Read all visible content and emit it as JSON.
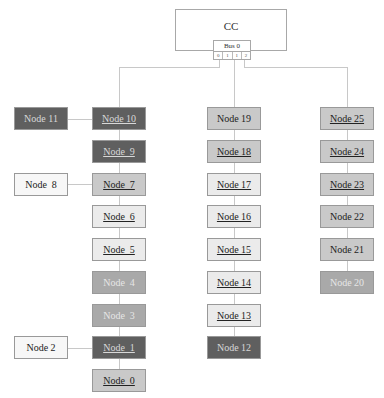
{
  "controller": {
    "label": "CC"
  },
  "bus": {
    "label": "Bus 0",
    "ports": [
      "0",
      "1",
      "1",
      "2"
    ]
  },
  "colors": {
    "dark": "#5f5f5f",
    "mid": "#a9a9a9",
    "light_mid": "#c9c9c9",
    "light": "#ebebeb",
    "white": "#f7f7f7"
  },
  "columns": [
    {
      "nodes": [
        {
          "label": "Node 10",
          "style": "dark",
          "underline": true
        },
        {
          "label": "Node  9",
          "style": "dark",
          "underline": true
        },
        {
          "label": "Node  7",
          "style": "light_mid",
          "underline": true
        },
        {
          "label": "Node  6",
          "style": "light",
          "underline": true
        },
        {
          "label": "Node  5",
          "style": "light",
          "underline": true
        },
        {
          "label": "Node  4",
          "style": "mid",
          "underline": false
        },
        {
          "label": "Node  3",
          "style": "mid",
          "underline": false
        },
        {
          "label": "Node  1",
          "style": "dark",
          "underline": true
        },
        {
          "label": "Node  0",
          "style": "light_mid",
          "underline": true
        }
      ]
    },
    {
      "nodes": [
        {
          "label": "Node 19",
          "style": "light_mid",
          "underline": false
        },
        {
          "label": "Node 18",
          "style": "light_mid",
          "underline": true
        },
        {
          "label": "Node 17",
          "style": "light",
          "underline": true
        },
        {
          "label": "Node 16",
          "style": "light",
          "underline": true
        },
        {
          "label": "Node 15",
          "style": "light",
          "underline": true
        },
        {
          "label": "Node 14",
          "style": "light",
          "underline": true
        },
        {
          "label": "Node 13",
          "style": "light",
          "underline": true
        },
        {
          "label": "Node 12",
          "style": "dark",
          "underline": false
        }
      ]
    },
    {
      "nodes": [
        {
          "label": "Node 25",
          "style": "light_mid",
          "underline": true
        },
        {
          "label": "Node 24",
          "style": "light_mid",
          "underline": true
        },
        {
          "label": "Node 23",
          "style": "light_mid",
          "underline": true
        },
        {
          "label": "Node 22",
          "style": "light_mid",
          "underline": false
        },
        {
          "label": "Node 21",
          "style": "light_mid",
          "underline": false
        },
        {
          "label": "Node 20",
          "style": "mid",
          "underline": false
        }
      ]
    }
  ],
  "side_nodes": [
    {
      "label": "Node 11",
      "style": "dark",
      "attached_row": 0
    },
    {
      "label": "Node  8",
      "style": "white",
      "attached_row": 2
    },
    {
      "label": "Node 2",
      "style": "white",
      "attached_row": 7
    }
  ]
}
